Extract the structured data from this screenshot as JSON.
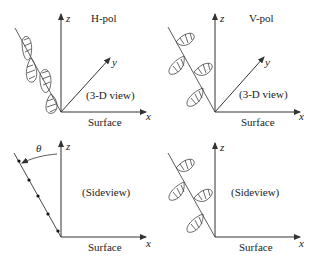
{
  "figure": {
    "panels": [
      {
        "id": "top-left",
        "title": "H-pol",
        "view": "(3-D view)",
        "axes": {
          "z": "z",
          "y": "y",
          "x": "x"
        },
        "surface": "Surface"
      },
      {
        "id": "top-right",
        "title": "V-pol",
        "view": "(3-D view)",
        "axes": {
          "z": "z",
          "y": "y",
          "x": "x"
        },
        "surface": "Surface"
      },
      {
        "id": "bottom-left",
        "view": "(Sideview)",
        "angle": "θ",
        "axes": {
          "z": "z",
          "x": "x"
        },
        "surface": "Surface"
      },
      {
        "id": "bottom-right",
        "view": "(Sideview)",
        "axes": {
          "z": "z",
          "x": "x"
        },
        "surface": "Surface"
      }
    ]
  },
  "colors": {
    "line": "#333333",
    "text": "#222222",
    "background": "#ffffff"
  }
}
